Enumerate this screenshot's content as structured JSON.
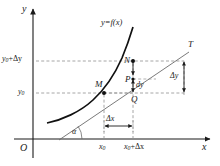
{
  "figure": {
    "type": "calculus-differential-diagram",
    "background": "#ffffff",
    "ink": "#1a1a1a",
    "curve_color": "#000000",
    "guide_color": "#8a8a8a"
  },
  "axes": {
    "x_label": "x",
    "y_label": "y",
    "origin_label": "O",
    "x_axis_y_px": 139,
    "y_axis_x_px": 33
  },
  "curve": {
    "label_prefix": "y",
    "label_eq": "=",
    "label_fn": "f",
    "label_arg": "(x)",
    "label_full": "y=f(x)"
  },
  "tangent": {
    "label": "T",
    "angle_label": "α"
  },
  "points": [
    {
      "name": "M",
      "x_px": 104,
      "y_px": 93,
      "label_dx": -9,
      "label_dy": -12
    },
    {
      "name": "N",
      "x_px": 133,
      "y_px": 61,
      "label_dx": -9,
      "label_dy": -4
    },
    {
      "name": "P",
      "x_px": 133,
      "y_px": 79,
      "label_dx": -8,
      "label_dy": -3
    },
    {
      "name": "Q",
      "x_px": 133,
      "y_px": 93,
      "label_dx": -2,
      "label_dy": 5
    }
  ],
  "ticks": {
    "y": [
      {
        "value_main": "y",
        "value_sub": "0",
        "value_extra": "+Δy",
        "text": "y0+Δy",
        "y_px": 61
      },
      {
        "value_main": "y",
        "value_sub": "0",
        "value_extra": "",
        "text": "y0",
        "y_px": 93
      }
    ],
    "x": [
      {
        "value_main": "x",
        "value_sub": "0",
        "value_extra": "",
        "text": "x0",
        "x_px": 104
      },
      {
        "value_main": "x",
        "value_sub": "0",
        "value_extra": "+Δx",
        "text": "x0+Δx",
        "x_px": 133
      }
    ]
  },
  "measures": [
    {
      "name": "delta-x",
      "text": "Δx",
      "x_px": 112,
      "y_px": 117
    },
    {
      "name": "delta-y",
      "text": "Δy",
      "x_px": 173,
      "y_px": 77
    },
    {
      "name": "dy",
      "text": "dy",
      "d_part": "d",
      "y_part": "y",
      "x_px": 137,
      "y_px": 85
    }
  ]
}
